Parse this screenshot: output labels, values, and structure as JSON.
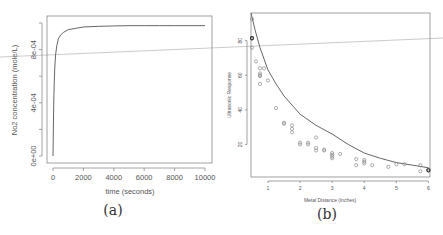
{
  "chart_data": [
    {
      "id": "a",
      "type": "line",
      "caption": "(a)",
      "title": "",
      "xlabel": "time (seconds)",
      "ylabel": "No2 concentration (mole/L)",
      "xlim": [
        0,
        10000
      ],
      "ylim": [
        0,
        0.001
      ],
      "xticks": [
        0,
        2000,
        4000,
        6000,
        8000,
        10000
      ],
      "xtick_labels": [
        "0",
        "2000",
        "4000",
        "6000",
        "8000",
        "10000"
      ],
      "yticks": [
        0,
        0.0002,
        0.0004,
        0.0006,
        0.0008,
        0.001
      ],
      "ytick_labels": [
        "0e+00",
        "",
        "4e-04",
        "",
        "8e-04",
        ""
      ],
      "grid": false,
      "series": [
        {
          "name": "NO2 concentration",
          "x": [
            0,
            20,
            50,
            80,
            120,
            170,
            250,
            350,
            500,
            700,
            1000,
            1500,
            2000,
            3000,
            4000,
            5000,
            6000,
            7000,
            8000,
            9000,
            10000
          ],
          "y": [
            0,
            0.00018,
            0.0004,
            0.00055,
            0.00067,
            0.00076,
            0.00083,
            0.00088,
            0.00091,
            0.00093,
            0.00095,
            0.00096,
            0.00097,
            0.000975,
            0.000978,
            0.00098,
            0.00098,
            0.00098,
            0.00098,
            0.00098,
            0.00098
          ]
        }
      ]
    },
    {
      "id": "b",
      "type": "scatter",
      "caption": "(b)",
      "title": "",
      "xlabel": "Metal Distance (inches)",
      "ylabel": "Ultrasonic Response",
      "xlim": [
        0.47,
        6.05
      ],
      "ylim": [
        0,
        96
      ],
      "xticks": [
        1,
        2,
        3,
        4,
        5,
        6
      ],
      "xtick_labels": [
        "1",
        "2",
        "3",
        "4",
        "5",
        "6"
      ],
      "yticks": [
        20,
        40,
        60,
        80
      ],
      "ytick_labels": [
        "20",
        "40",
        "60",
        "80"
      ],
      "grid": false,
      "points": {
        "x": [
          0.5,
          0.5,
          0.5,
          0.5,
          0.625,
          0.75,
          0.75,
          0.75,
          0.75,
          0.75,
          0.875,
          1.0,
          1.25,
          1.5,
          1.5,
          1.75,
          1.75,
          1.75,
          2.0,
          2.0,
          2.25,
          2.25,
          2.5,
          2.5,
          2.5,
          2.75,
          2.75,
          3.0,
          3.0,
          3.0,
          3.0,
          3.25,
          3.75,
          3.75,
          4.0,
          4.0,
          4.0,
          4.25,
          4.75,
          5.0,
          5.25,
          5.75,
          5.75,
          6.0,
          6.0
        ],
        "y": [
          92.5,
          81.5,
          81.0,
          76.0,
          68.0,
          64.0,
          61.0,
          60.0,
          59.5,
          55.0,
          64.0,
          57.0,
          41.0,
          32.5,
          32.0,
          31.0,
          29.0,
          27.0,
          21.0,
          20.0,
          21.0,
          20.0,
          24.0,
          18.0,
          16.5,
          17.0,
          16.5,
          15.0,
          14.0,
          13.0,
          12.0,
          14.5,
          11.5,
          8.0,
          11.0,
          10.0,
          9.0,
          8.0,
          7.0,
          8.5,
          8.5,
          8.0,
          4.5,
          5.5,
          5.0
        ]
      },
      "dark_points": {
        "x": [
          0.5,
          6.0
        ],
        "y": [
          81.5,
          5.0
        ]
      },
      "fit_curve": {
        "name": "fitted model",
        "x": [
          0.47,
          0.6,
          0.75,
          1.0,
          1.25,
          1.5,
          2.0,
          2.5,
          3.0,
          3.5,
          4.0,
          4.5,
          5.0,
          5.5,
          6.0
        ],
        "y": [
          96,
          86,
          76,
          63,
          55,
          48,
          37.5,
          31,
          26,
          20,
          15,
          12,
          9.5,
          8,
          6.5
        ]
      }
    }
  ]
}
